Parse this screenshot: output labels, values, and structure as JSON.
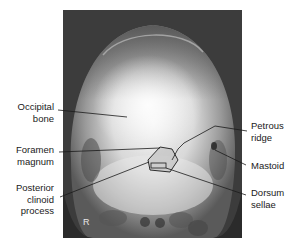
{
  "figure": {
    "side_marker": "R",
    "labels_left": [
      {
        "id": "occipital-bone",
        "lines": [
          "Occipital",
          "bone"
        ]
      },
      {
        "id": "foramen-magnum",
        "lines": [
          "Foramen",
          "magnum"
        ]
      },
      {
        "id": "posterior-clinoid-process",
        "lines": [
          "Posterior",
          "clinoid",
          "process"
        ]
      }
    ],
    "labels_right": [
      {
        "id": "petrous-ridge",
        "lines": [
          "Petrous",
          "ridge"
        ]
      },
      {
        "id": "mastoid",
        "lines": [
          "Mastoid"
        ]
      },
      {
        "id": "dorsum-sellae",
        "lines": [
          "Dorsum",
          "sellae"
        ]
      }
    ]
  }
}
